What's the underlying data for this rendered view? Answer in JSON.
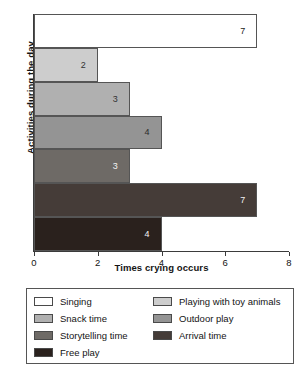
{
  "chart_data": {
    "type": "bar",
    "orientation": "horizontal",
    "title": "",
    "xlabel": "Times crying occurs",
    "ylabel": "Activities during the day",
    "xlim": [
      0,
      8
    ],
    "xticks": [
      0,
      2,
      4,
      6,
      8
    ],
    "xtick_labels": [
      "0",
      "2",
      "4",
      "6",
      "8"
    ],
    "grid": false,
    "legend_position": "below",
    "categories": [
      "Singing",
      "Playing with toy animals",
      "Snack time",
      "Outdoor play",
      "Storytelling time",
      "Arrival time",
      "Free play"
    ],
    "values": [
      7,
      2,
      3,
      4,
      3,
      7,
      4
    ],
    "value_labels": [
      "7",
      "2",
      "3",
      "4",
      "3",
      "7",
      "4"
    ],
    "colors": [
      "#ffffff",
      "#cdcdcd",
      "#b0b0b0",
      "#949494",
      "#6e6a66",
      "#453c38",
      "#2a211d"
    ],
    "value_label_colors": [
      "#222222",
      "#333333",
      "#333333",
      "#2b2b2b",
      "#f2f2f2",
      "#f2f2f2",
      "#f2f2f2"
    ],
    "bars": [
      {
        "category": "Singing",
        "value": 7,
        "label": "7",
        "color": "#ffffff",
        "label_color": "#222222"
      },
      {
        "category": "Playing with toy animals",
        "value": 2,
        "label": "2",
        "color": "#cdcdcd",
        "label_color": "#333333"
      },
      {
        "category": "Snack time",
        "value": 3,
        "label": "3",
        "color": "#b0b0b0",
        "label_color": "#333333"
      },
      {
        "category": "Outdoor play",
        "value": 4,
        "label": "4",
        "color": "#949494",
        "label_color": "#2b2b2b"
      },
      {
        "category": "Storytelling time",
        "value": 3,
        "label": "3",
        "color": "#6e6a66",
        "label_color": "#f2f2f2"
      },
      {
        "category": "Arrival time",
        "value": 7,
        "label": "7",
        "color": "#453c38",
        "label_color": "#f2f2f2"
      },
      {
        "category": "Free play",
        "value": 4,
        "label": "4",
        "color": "#2a211d",
        "label_color": "#f2f2f2"
      }
    ]
  },
  "legend": {
    "left_column": [
      {
        "label": "Singing",
        "color": "#ffffff"
      },
      {
        "label": "Snack time",
        "color": "#b0b0b0"
      },
      {
        "label": "Storytelling time",
        "color": "#6e6a66"
      },
      {
        "label": "Free play",
        "color": "#2a211d"
      }
    ],
    "right_column": [
      {
        "label": "Playing with toy animals",
        "color": "#cdcdcd"
      },
      {
        "label": "Outdoor play",
        "color": "#949494"
      },
      {
        "label": "Arrival time",
        "color": "#453c38"
      }
    ]
  }
}
